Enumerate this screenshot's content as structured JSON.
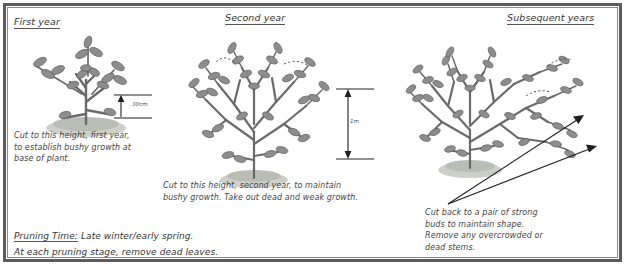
{
  "diagram": {
    "title_first": "First year",
    "title_second": "Second year",
    "title_third": "Subsequent years",
    "caption_first": "Cut to this height, first year,\nto establish bushy growth at\nbase of plant.",
    "caption_second": "Cut to this height, second year, to maintain\nbushy growth. Take out dead and weak growth.",
    "caption_third": "Cut back to a pair of strong\nbuds to maintain shape.\nRemove any overcrowded or\ndead stems.",
    "measure_first": "30cm",
    "measure_second": "1m",
    "pruning_label": "Pruning Time:",
    "pruning_text": " Late winter/early spring.",
    "pruning_line2": "At each pruning stage, remove dead leaves.",
    "colors": {
      "ink": "#3a3a3a",
      "stem": "#6a6a6a",
      "leaf": "#8d8d8d",
      "soil": "#b9bdb4",
      "frame": "#5c5c5c",
      "arrow": "#1f1f1f",
      "paper": "#ffffff"
    }
  }
}
